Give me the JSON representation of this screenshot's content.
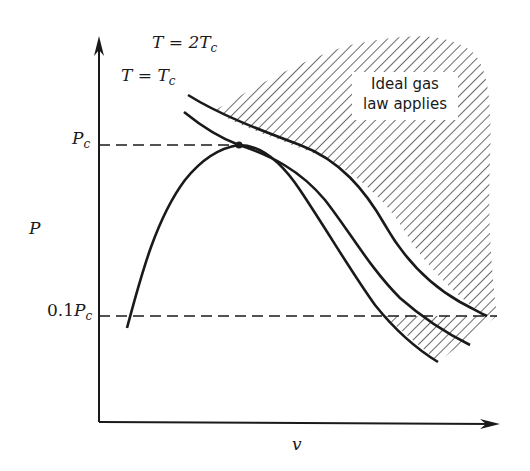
{
  "diagram": {
    "type": "P-v diagram",
    "axes": {
      "y_label": "P",
      "x_label": "v"
    },
    "reference_lines": {
      "critical_pressure": {
        "label_main": "P",
        "label_sub": "c"
      },
      "tenth_critical_pressure": {
        "label_prefix": "0.1",
        "label_main": "P",
        "label_sub": "c"
      }
    },
    "isotherms": [
      {
        "name": "T = 2Tc",
        "label_lhs": "T = 2",
        "label_var": "T",
        "label_sub": "c"
      },
      {
        "name": "T = Tc",
        "label_lhs": "T = ",
        "label_var": "T",
        "label_sub": "c"
      }
    ],
    "region_annotation": {
      "line1": "Ideal gas",
      "line2": "law applies"
    },
    "colors": {
      "ink": "#1a1a1a",
      "background": "#ffffff"
    }
  }
}
